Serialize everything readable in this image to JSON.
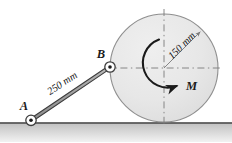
{
  "figure": {
    "background_color": "#ffffff",
    "ground": {
      "label": "ground-surface",
      "line_color": "#3d3d3d",
      "hatch_color": "#b9b9b9",
      "y": 123
    },
    "disk": {
      "name": "disk",
      "center_x": 164,
      "center_y": 68,
      "radius": 54,
      "fill_color": "#e7e7e7",
      "stroke_color": "#8a8a8a",
      "centerline_color": "#7a7a7a",
      "radius_dimension": {
        "label": "150 mm",
        "value": 150,
        "units": "mm",
        "angle_deg": -45,
        "text_rotation_deg": -45,
        "arrow_color": "#7a7a7a"
      },
      "moment": {
        "label": "M",
        "direction": "clockwise",
        "arc_color": "#1a1a1a"
      }
    },
    "bar": {
      "name": "bar-AB",
      "label": "250 mm",
      "value": 250,
      "units": "mm",
      "fill_color": "#9d9d9d",
      "stroke_color": "#3d3d3d",
      "text_rotation_deg": -31,
      "end_a": {
        "label": "A",
        "x": 31,
        "y": 120
      },
      "end_b": {
        "label": "B",
        "x": 110,
        "y": 67
      }
    },
    "pins": {
      "pin_fill": "#ffffff",
      "pin_stroke": "#3d3d3d",
      "dot_color": "#1a1a1a",
      "outer_radius": 5.2,
      "inner_radius": 1.7
    }
  }
}
